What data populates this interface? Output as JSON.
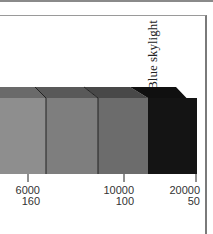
{
  "diagram": {
    "label": "Blue skylight",
    "segments": [
      {
        "name": "segment-1",
        "front_color": "#8e8e8e",
        "top_color": "#6a6a6a"
      },
      {
        "name": "segment-2",
        "front_color": "#7e7e7e",
        "top_color": "#595959"
      },
      {
        "name": "segment-3",
        "front_color": "#6c6c6c",
        "top_color": "#484848"
      },
      {
        "name": "segment-4",
        "front_color": "#141414",
        "top_color": "#0a0a0a"
      }
    ],
    "ticks": [
      {
        "top": "6000",
        "bottom": "160"
      },
      {
        "top": "10000",
        "bottom": "100"
      },
      {
        "top": "20000",
        "bottom": "50"
      }
    ]
  }
}
